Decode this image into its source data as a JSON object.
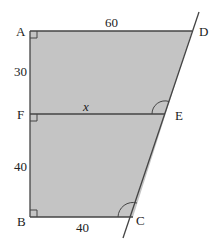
{
  "diagram": {
    "type": "geometry-trapezium",
    "fill_color": "#c4c4c4",
    "line_color": "#444444",
    "vertices": {
      "A": {
        "label": "A"
      },
      "B": {
        "label": "B"
      },
      "C": {
        "label": "C"
      },
      "D": {
        "label": "D"
      },
      "E": {
        "label": "E"
      },
      "F": {
        "label": "F"
      }
    },
    "lengths": {
      "AD": "60",
      "AF": "30",
      "FE": "x",
      "FB": "40",
      "BC": "40"
    },
    "right_angles": [
      "A",
      "F",
      "B"
    ],
    "marked_angles": [
      "E",
      "C"
    ]
  }
}
